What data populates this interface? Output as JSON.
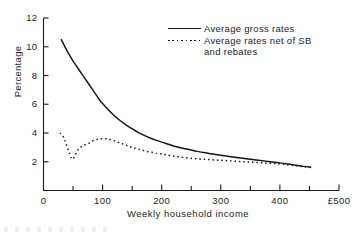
{
  "chart_data": {
    "type": "line",
    "title": "",
    "xlabel": "Weekly household income",
    "ylabel": "Percentage",
    "xlim": [
      0,
      500
    ],
    "ylim": [
      0,
      12
    ],
    "grid": false,
    "legend_position": "top-right",
    "x_ticks": [
      {
        "value": 0,
        "label": "0"
      },
      {
        "value": 50,
        "label": ""
      },
      {
        "value": 100,
        "label": "100"
      },
      {
        "value": 150,
        "label": ""
      },
      {
        "value": 200,
        "label": "200"
      },
      {
        "value": 250,
        "label": ""
      },
      {
        "value": 300,
        "label": "300"
      },
      {
        "value": 350,
        "label": ""
      },
      {
        "value": 400,
        "label": "400"
      },
      {
        "value": 450,
        "label": ""
      },
      {
        "value": 500,
        "label": "£500"
      }
    ],
    "y_ticks": [
      {
        "value": 2,
        "label": "2"
      },
      {
        "value": 4,
        "label": "4"
      },
      {
        "value": 6,
        "label": "6"
      },
      {
        "value": 8,
        "label": "8"
      },
      {
        "value": 10,
        "label": "10"
      },
      {
        "value": 12,
        "label": "12"
      }
    ],
    "series": [
      {
        "name": "Average gross rates",
        "style": "solid",
        "color": "#141414",
        "x": [
          30,
          35,
          40,
          45,
          50,
          55,
          60,
          65,
          70,
          75,
          80,
          85,
          90,
          95,
          100,
          110,
          120,
          130,
          140,
          150,
          160,
          175,
          190,
          205,
          220,
          240,
          260,
          280,
          300,
          320,
          340,
          360,
          380,
          400,
          420,
          440,
          452
        ],
        "y": [
          10.5,
          10.1,
          9.7,
          9.35,
          9.0,
          8.7,
          8.4,
          8.1,
          7.8,
          7.5,
          7.2,
          6.9,
          6.6,
          6.3,
          6.05,
          5.6,
          5.2,
          4.85,
          4.55,
          4.3,
          4.05,
          3.75,
          3.5,
          3.3,
          3.1,
          2.9,
          2.72,
          2.58,
          2.45,
          2.33,
          2.22,
          2.12,
          2.02,
          1.92,
          1.8,
          1.68,
          1.62
        ]
      },
      {
        "name": "Average rates net of SB and rebates",
        "style": "dotted",
        "color": "#141414",
        "x": [
          28,
          32,
          36,
          40,
          44,
          47,
          50,
          53,
          57,
          61,
          66,
          71,
          77,
          83,
          90,
          97,
          105,
          112,
          120,
          130,
          140,
          150,
          160,
          175,
          190,
          205,
          220,
          240,
          260,
          280,
          300,
          320,
          340,
          360,
          380,
          400,
          420,
          440,
          452
        ],
        "y": [
          4.0,
          3.85,
          3.5,
          3.05,
          2.6,
          2.25,
          2.2,
          2.4,
          2.75,
          2.95,
          3.1,
          3.2,
          3.3,
          3.45,
          3.55,
          3.6,
          3.6,
          3.55,
          3.45,
          3.3,
          3.15,
          3.0,
          2.88,
          2.72,
          2.6,
          2.5,
          2.4,
          2.28,
          2.2,
          2.15,
          2.1,
          2.05,
          2.0,
          1.95,
          1.9,
          1.85,
          1.76,
          1.66,
          1.6
        ]
      }
    ],
    "annotations": []
  },
  "legend": {
    "entries": [
      {
        "label": "Average gross rates"
      },
      {
        "label": "Average rates net of SB"
      },
      {
        "label": "and rebates"
      }
    ]
  }
}
